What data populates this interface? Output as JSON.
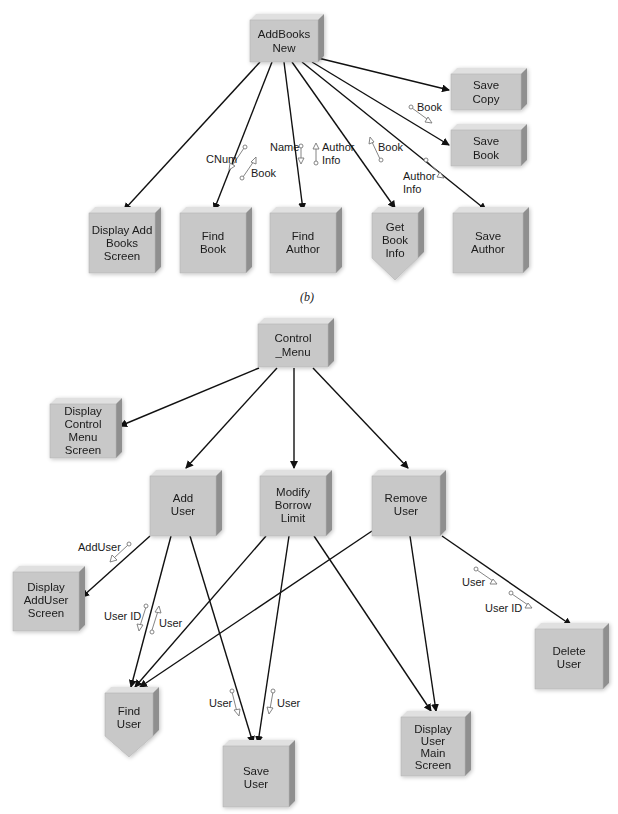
{
  "caption": "(b)",
  "diagrams": [
    {
      "name": "addbooks-structure-chart",
      "nodes": [
        {
          "id": "addbooks_new",
          "lines": [
            "AddBooks",
            "New"
          ],
          "x": 250,
          "y": 14,
          "w": 68,
          "h": 48,
          "shape": "box"
        },
        {
          "id": "save_copy",
          "lines": [
            "Save",
            "Copy"
          ],
          "x": 451,
          "y": 68,
          "w": 72,
          "h": 40,
          "shape": "box"
        },
        {
          "id": "save_book",
          "lines": [
            "Save",
            "Book"
          ],
          "x": 451,
          "y": 124,
          "w": 72,
          "h": 40,
          "shape": "box"
        },
        {
          "id": "display_add_books_screen",
          "lines": [
            "Display Add",
            "Books",
            "Screen"
          ],
          "x": 89,
          "y": 207,
          "w": 70,
          "h": 64,
          "shape": "box"
        },
        {
          "id": "find_book",
          "lines": [
            "Find",
            "Book"
          ],
          "x": 180,
          "y": 207,
          "w": 70,
          "h": 64,
          "shape": "box"
        },
        {
          "id": "find_author",
          "lines": [
            "Find",
            "Author"
          ],
          "x": 270,
          "y": 207,
          "w": 70,
          "h": 64,
          "shape": "box"
        },
        {
          "id": "get_book_info",
          "lines": [
            "Get",
            "Book",
            "Info"
          ],
          "x": 372,
          "y": 207,
          "w": 48,
          "h": 50,
          "shape": "pentagon"
        },
        {
          "id": "save_author",
          "lines": [
            "Save",
            "Author"
          ],
          "x": 453,
          "y": 207,
          "w": 72,
          "h": 64,
          "shape": "box"
        }
      ],
      "flows": [
        {
          "label": "CNum",
          "label_x": 232,
          "label_y": 159
        },
        {
          "label": "Book",
          "label_x": 250,
          "label_y": 176
        },
        {
          "label": "Name",
          "label_x": 270,
          "label_y": 150
        },
        {
          "label": "Author",
          "label_x": 321,
          "label_y": 150
        },
        {
          "label": "Info",
          "label_x": 321,
          "label_y": 163
        },
        {
          "label": "Book",
          "label_x": 378,
          "label_y": 150
        },
        {
          "label": "Book",
          "label_x": 418,
          "label_y": 111
        },
        {
          "label": "Author",
          "label_x": 403,
          "label_y": 180
        },
        {
          "label": "Info",
          "label_x": 403,
          "label_y": 193
        }
      ]
    },
    {
      "name": "control-menu-structure-chart",
      "nodes": [
        {
          "id": "control_menu",
          "lines": [
            "Control",
            "_Menu"
          ],
          "x": 258,
          "y": 318,
          "w": 70,
          "h": 48,
          "shape": "box"
        },
        {
          "id": "display_control_menu_screen",
          "lines": [
            "Display",
            "Control",
            "Menu",
            "Screen"
          ],
          "x": 50,
          "y": 398,
          "w": 66,
          "h": 60,
          "shape": "box"
        },
        {
          "id": "add_user",
          "lines": [
            "Add",
            "User"
          ],
          "x": 150,
          "y": 476,
          "w": 68,
          "h": 60,
          "shape": "box"
        },
        {
          "id": "modify_borrow_limit",
          "lines": [
            "Modify",
            "Borrow",
            "Limit"
          ],
          "x": 260,
          "y": 476,
          "w": 68,
          "h": 60,
          "shape": "box"
        },
        {
          "id": "remove_user",
          "lines": [
            "Remove",
            "User"
          ],
          "x": 372,
          "y": 474,
          "w": 68,
          "h": 62,
          "shape": "box"
        },
        {
          "id": "display_adduser_screen",
          "lines": [
            "Display",
            "AddUser",
            "Screen"
          ],
          "x": 13,
          "y": 569,
          "w": 66,
          "h": 60,
          "shape": "box"
        },
        {
          "id": "delete_user",
          "lines": [
            "Delete",
            "User"
          ],
          "x": 535,
          "y": 623,
          "w": 68,
          "h": 62,
          "shape": "box"
        },
        {
          "id": "find_user",
          "lines": [
            "Find",
            "User"
          ],
          "x": 105,
          "y": 688,
          "w": 48,
          "h": 50,
          "shape": "pentagon"
        },
        {
          "id": "save_user",
          "lines": [
            "Save",
            "User"
          ],
          "x": 223,
          "y": 740,
          "w": 68,
          "h": 62,
          "shape": "box"
        },
        {
          "id": "display_user_main_screen",
          "lines": [
            "Display",
            "User",
            "Main",
            "Screen"
          ],
          "x": 401,
          "y": 712,
          "w": 66,
          "h": 62,
          "shape": "box"
        }
      ],
      "flows": [
        {
          "label": "AddUser",
          "label_x": 78,
          "label_y": 551
        },
        {
          "label": "User ID",
          "label_x": 104,
          "label_y": 620
        },
        {
          "label": "User",
          "label_x": 159,
          "label_y": 627
        },
        {
          "label": "User",
          "label_x": 209,
          "label_y": 706
        },
        {
          "label": "User",
          "label_x": 277,
          "label_y": 706
        },
        {
          "label": "User",
          "label_x": 462,
          "label_y": 585
        },
        {
          "label": "User ID",
          "label_x": 485,
          "label_y": 612
        }
      ]
    }
  ]
}
